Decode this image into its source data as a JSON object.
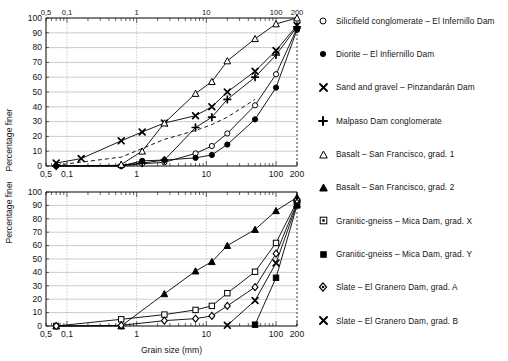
{
  "figure": {
    "xlabel": "Grain size (mm)",
    "ylabel": "Percentage finer"
  },
  "axes": {
    "x_tick_labels": [
      "0,5",
      "0,1",
      "1",
      "10",
      "100",
      "200"
    ],
    "x_tick_values": [
      0.05,
      0.1,
      1,
      10,
      100,
      200
    ],
    "x_range": [
      0.05,
      200
    ],
    "y_tick_labels": [
      "0",
      "10",
      "20",
      "30",
      "40",
      "50",
      "60",
      "70",
      "80",
      "90",
      "100"
    ],
    "y_range": [
      0,
      100
    ],
    "grid": true,
    "x_scale": "log",
    "y_scale": "linear"
  },
  "legend": {
    "position": "right",
    "items": [
      {
        "marker": "open-circle",
        "label": "Silicifield conglomerate – El Infernillo Dam"
      },
      {
        "marker": "filled-circle",
        "label": "Diorite – El Infiernillo Dam"
      },
      {
        "marker": "cross-x",
        "label": "Sand and gravel – Pinzandarán Dam"
      },
      {
        "marker": "plus",
        "label": "Malpaso Dam conglomerate"
      },
      {
        "marker": "open-triangle",
        "label": "Basalt – San Francisco, grad. 1"
      },
      {
        "marker": "filled-triangle",
        "label": "Basalt – San Francisco, grad. 2"
      },
      {
        "marker": "open-square",
        "label": "Granitic-gneiss – Mica Dam, grad. X"
      },
      {
        "marker": "filled-square",
        "label": "Granitic-gneiss – Mica Dam, grad. Y"
      },
      {
        "marker": "open-diamond",
        "label": "Slate – El Granero Dam, grad. A"
      },
      {
        "marker": "bold-x",
        "label": "Slate – El Granero Dam, grad. B"
      }
    ]
  },
  "chart_data": [
    {
      "type": "line",
      "id": "upper-panel",
      "title": "",
      "xlabel": "",
      "ylabel": "Percentage finer",
      "x_scale": "log",
      "xlim": [
        0.05,
        200
      ],
      "ylim": [
        0,
        100
      ],
      "grid": true,
      "series": [
        {
          "name": "Silicifield conglomerate – El Infernillo Dam",
          "marker": "open-circle",
          "linestyle": "solid",
          "x": [
            0.07,
            0.6,
            1.2,
            2.5,
            7,
            12,
            20,
            50,
            100,
            200
          ],
          "y": [
            0,
            0,
            1.5,
            2.5,
            8.5,
            13.5,
            22,
            41,
            62,
            93
          ]
        },
        {
          "name": "Diorite – El Infiernillo Dam",
          "marker": "filled-circle",
          "linestyle": "solid",
          "x": [
            0.07,
            0.6,
            1.2,
            2.5,
            7,
            12,
            20,
            50,
            100,
            200
          ],
          "y": [
            0,
            0,
            3.5,
            4,
            5.5,
            7.5,
            14.5,
            31.5,
            53,
            92
          ]
        },
        {
          "name": "Sand and gravel – Pinzandarán Dam",
          "marker": "cross-x",
          "linestyle": "solid",
          "x": [
            0.07,
            0.16,
            0.6,
            1.2,
            2.5,
            7,
            12,
            20,
            50,
            100,
            200
          ],
          "y": [
            2,
            5,
            17,
            23,
            29,
            34,
            40,
            50,
            64,
            78,
            95
          ]
        },
        {
          "name": "Malpaso Dam conglomerate",
          "marker": "plus",
          "linestyle": "solid",
          "x": [
            0.07,
            0.6,
            1.2,
            2.5,
            7,
            12,
            20,
            50,
            100,
            200
          ],
          "y": [
            0,
            0.5,
            2,
            4,
            26,
            33,
            45,
            60,
            75,
            94
          ]
        },
        {
          "name": "Basalt – San Francisco, grad. 1",
          "marker": "open-triangle",
          "linestyle": "solid",
          "x": [
            0.6,
            1.2,
            2.5,
            7,
            12,
            20,
            50,
            100,
            200
          ],
          "y": [
            1,
            10,
            29,
            49,
            57,
            71,
            86,
            96,
            100
          ]
        },
        {
          "name": "unlabelled dashed curve",
          "marker": "none",
          "linestyle": "dashed",
          "x": [
            0.07,
            0.6,
            2.5,
            7,
            12,
            20,
            50
          ],
          "y": [
            0.5,
            6,
            18,
            24,
            28,
            33,
            45
          ]
        }
      ]
    },
    {
      "type": "line",
      "id": "lower-panel",
      "title": "",
      "xlabel": "Grain size (mm)",
      "ylabel": "Percentage finer",
      "x_scale": "log",
      "xlim": [
        0.05,
        200
      ],
      "ylim": [
        0,
        100
      ],
      "grid": true,
      "series": [
        {
          "name": "Basalt – San Francisco, grad. 2",
          "marker": "filled-triangle",
          "linestyle": "solid",
          "x": [
            0.07,
            0.6,
            2.5,
            7,
            12,
            20,
            50,
            100,
            200
          ],
          "y": [
            0,
            0,
            24,
            41,
            48,
            60,
            72,
            86,
            96
          ]
        },
        {
          "name": "Granitic-gneiss – Mica Dam, grad. X",
          "marker": "open-square",
          "linestyle": "solid",
          "x": [
            0.07,
            0.6,
            2.5,
            7,
            12,
            20,
            50,
            100,
            200
          ],
          "y": [
            0,
            5,
            8.5,
            12,
            15,
            24.5,
            40.5,
            62,
            93
          ]
        },
        {
          "name": "Granitic-gneiss – Mica Dam, grad. Y",
          "marker": "filled-square",
          "linestyle": "solid",
          "x": [
            50,
            100,
            200
          ],
          "y": [
            1,
            36,
            90
          ]
        },
        {
          "name": "Slate – El Granero Dam, grad. A",
          "marker": "open-diamond",
          "linestyle": "solid",
          "x": [
            0.07,
            0.6,
            2.5,
            7,
            12,
            20,
            50,
            100,
            200
          ],
          "y": [
            0,
            0.5,
            4,
            5.5,
            7.5,
            15,
            29,
            54,
            92
          ]
        },
        {
          "name": "Slate – El Granero Dam, grad. B",
          "marker": "bold-x",
          "linestyle": "solid",
          "x": [
            20,
            50,
            100,
            200
          ],
          "y": [
            0.5,
            19,
            47,
            91
          ]
        }
      ]
    }
  ]
}
